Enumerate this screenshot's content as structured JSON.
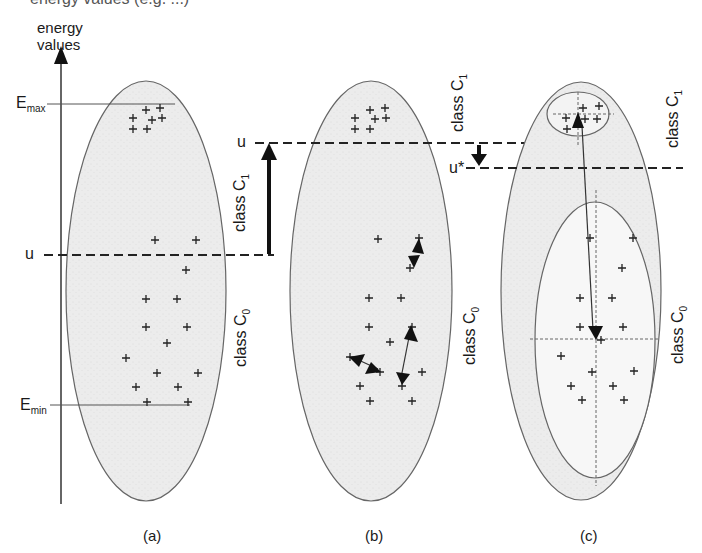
{
  "figure": {
    "top_fragment": "energy values (e.g. ...)",
    "axis": {
      "label_line1": "energy",
      "label_line2": "values",
      "emax_label": "E",
      "emax_sub": "max",
      "emin_label": "E",
      "emin_sub": "min",
      "u_label": "u"
    },
    "panels": [
      {
        "id": "a",
        "caption": "(a)",
        "class_upper": {
          "text": "class C",
          "sub": "1"
        },
        "class_lower": {
          "text": "class C",
          "sub": "0"
        },
        "points_upper": [
          [
            146,
            110
          ],
          [
            160,
            108
          ],
          [
            133,
            118
          ],
          [
            152,
            120
          ],
          [
            162,
            118
          ],
          [
            133,
            129
          ],
          [
            147,
            129
          ]
        ],
        "points_lower": [
          [
            155,
            240
          ],
          [
            196,
            240
          ],
          [
            186,
            270
          ],
          [
            146,
            299
          ],
          [
            177,
            299
          ],
          [
            146,
            327
          ],
          [
            187,
            327
          ],
          [
            167,
            343
          ],
          [
            126,
            358
          ],
          [
            157,
            373
          ],
          [
            198,
            373
          ],
          [
            136,
            387
          ],
          [
            178,
            387
          ],
          [
            147,
            402
          ],
          [
            188,
            402
          ]
        ]
      },
      {
        "id": "b",
        "caption": "(b)",
        "u_label": "u",
        "class_upper": {
          "text": "class C",
          "sub": "1"
        },
        "class_lower": {
          "text": "class C",
          "sub": "0"
        },
        "points_upper": [
          [
            370,
            110
          ],
          [
            385,
            108
          ],
          [
            355,
            118
          ],
          [
            375,
            119
          ],
          [
            386,
            118
          ],
          [
            355,
            129
          ],
          [
            370,
            129
          ]
        ],
        "points_lower": [
          [
            378,
            239
          ],
          [
            419,
            238
          ],
          [
            410,
            268
          ],
          [
            369,
            298
          ],
          [
            401,
            298
          ],
          [
            369,
            327
          ],
          [
            412,
            327
          ],
          [
            390,
            342
          ],
          [
            350,
            357
          ],
          [
            380,
            372
          ],
          [
            422,
            372
          ],
          [
            360,
            386
          ],
          [
            402,
            386
          ],
          [
            370,
            401
          ],
          [
            412,
            401
          ]
        ]
      },
      {
        "id": "c",
        "caption": "(c)",
        "u_star_label": "u*",
        "class_upper": {
          "text": "class C",
          "sub": "1"
        },
        "class_lower": {
          "text": "class C",
          "sub": "0"
        },
        "points_upper": [
          [
            583,
            108
          ],
          [
            599,
            106
          ],
          [
            566,
            118
          ],
          [
            585,
            119
          ],
          [
            597,
            119
          ],
          [
            567,
            129
          ]
        ],
        "points_lower": [
          [
            590,
            238
          ],
          [
            633,
            238
          ],
          [
            622,
            268
          ],
          [
            580,
            298
          ],
          [
            612,
            298
          ],
          [
            580,
            327
          ],
          [
            623,
            327
          ],
          [
            601,
            340
          ],
          [
            561,
            356
          ],
          [
            592,
            372
          ],
          [
            634,
            371
          ],
          [
            571,
            386
          ],
          [
            613,
            386
          ],
          [
            582,
            400
          ],
          [
            624,
            400
          ]
        ]
      }
    ]
  }
}
